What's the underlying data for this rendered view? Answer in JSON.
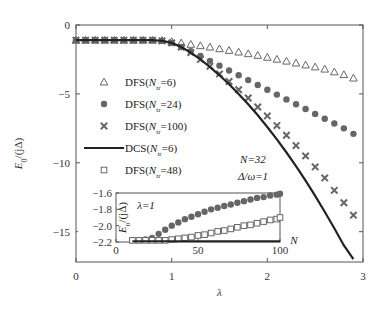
{
  "chart_data": [
    {
      "type": "line",
      "title": "",
      "xlabel": "λ",
      "ylabel": "E0/(jΔ)",
      "xlim": [
        0,
        3
      ],
      "ylim": [
        -17.2,
        0
      ],
      "xticks": [
        0,
        1,
        2,
        3
      ],
      "yticks": [
        0,
        -5,
        -10,
        -15
      ],
      "xtick_labels": [
        "0",
        "1",
        "2",
        "3"
      ],
      "ytick_labels": [
        "0",
        "−5",
        "−10",
        "−15"
      ],
      "grid": false,
      "legend_position": "left",
      "annotations": [
        "N=32",
        "Δ/ω=1"
      ],
      "x": [
        0,
        0.1,
        0.2,
        0.3,
        0.4,
        0.5,
        0.6,
        0.7,
        0.8,
        0.9,
        1.0,
        1.1,
        1.2,
        1.3,
        1.4,
        1.5,
        1.6,
        1.7,
        1.8,
        1.9,
        2.0,
        2.1,
        2.2,
        2.3,
        2.4,
        2.5,
        2.6,
        2.7,
        2.8,
        2.9
      ],
      "series": [
        {
          "name": "DFS(Ntr=6)",
          "marker": "triangle",
          "values": [
            -1.1,
            -1.1,
            -1.1,
            -1.1,
            -1.1,
            -1.1,
            -1.1,
            -1.1,
            -1.1,
            -1.12,
            -1.2,
            -1.3,
            -1.4,
            -1.5,
            -1.6,
            -1.72,
            -1.84,
            -1.96,
            -2.08,
            -2.2,
            -2.34,
            -2.48,
            -2.62,
            -2.76,
            -2.9,
            -3.04,
            -3.2,
            -3.4,
            -3.6,
            -3.85
          ]
        },
        {
          "name": "DFS(Ntr=24)",
          "marker": "circle",
          "values": [
            -1.1,
            -1.1,
            -1.1,
            -1.1,
            -1.1,
            -1.1,
            -1.1,
            -1.1,
            -1.1,
            -1.15,
            -1.3,
            -1.6,
            -1.9,
            -2.25,
            -2.6,
            -2.95,
            -3.3,
            -3.65,
            -4.0,
            -4.35,
            -4.7,
            -5.05,
            -5.4,
            -5.75,
            -6.1,
            -6.45,
            -6.8,
            -7.15,
            -7.5,
            -7.9
          ]
        },
        {
          "name": "DFS(Ntr=100)",
          "marker": "cross",
          "values": [
            -1.1,
            -1.1,
            -1.1,
            -1.1,
            -1.1,
            -1.1,
            -1.1,
            -1.1,
            -1.1,
            -1.15,
            -1.3,
            -1.6,
            -2.0,
            -2.5,
            -3.0,
            -3.55,
            -4.1,
            -4.7,
            -5.3,
            -5.95,
            -6.6,
            -7.3,
            -8.0,
            -8.75,
            -9.5,
            -10.3,
            -11.1,
            -12.0,
            -12.9,
            -13.8
          ]
        },
        {
          "name": "DCS(Ntr=6)",
          "marker": "line",
          "values": [
            -1.1,
            -1.1,
            -1.1,
            -1.1,
            -1.1,
            -1.1,
            -1.1,
            -1.1,
            -1.1,
            -1.15,
            -1.3,
            -1.6,
            -2.0,
            -2.5,
            -3.05,
            -3.65,
            -4.3,
            -5.0,
            -5.75,
            -6.55,
            -7.4,
            -8.3,
            -9.25,
            -10.25,
            -11.3,
            -12.4,
            -13.55,
            -14.75,
            -16.0,
            -17.0
          ]
        },
        {
          "name": "DFS(Ntr=48)",
          "marker": "square",
          "values": []
        }
      ]
    },
    {
      "type": "line",
      "title": "",
      "xlabel": "N",
      "ylabel": "E0/(jΔ)",
      "annotation": "λ=1",
      "xlim": [
        0,
        100
      ],
      "ylim": [
        -2.2,
        -1.6
      ],
      "xticks": [
        0,
        50,
        100
      ],
      "yticks": [
        -1.6,
        -1.8,
        -2.0,
        -2.2
      ],
      "xtick_labels": [
        "0",
        "50",
        "100"
      ],
      "ytick_labels": [
        "−1.6",
        "−1.8",
        "−2.0",
        "−2.2"
      ],
      "x": [
        10,
        14,
        18,
        22,
        26,
        30,
        34,
        38,
        42,
        46,
        50,
        54,
        58,
        62,
        66,
        70,
        74,
        78,
        82,
        86,
        90,
        94,
        98,
        100
      ],
      "series": [
        {
          "name": "DFS(Ntr=24)",
          "marker": "circle",
          "values": [
            -2.18,
            -2.18,
            -2.17,
            -2.15,
            -2.1,
            -2.05,
            -2.0,
            -1.96,
            -1.92,
            -1.89,
            -1.86,
            -1.83,
            -1.8,
            -1.78,
            -1.76,
            -1.74,
            -1.72,
            -1.7,
            -1.68,
            -1.66,
            -1.65,
            -1.63,
            -1.62,
            -1.61
          ]
        },
        {
          "name": "DFS(Ntr=48)",
          "marker": "square",
          "values": [
            -2.18,
            -2.18,
            -2.18,
            -2.18,
            -2.18,
            -2.18,
            -2.17,
            -2.16,
            -2.15,
            -2.14,
            -2.12,
            -2.11,
            -2.09,
            -2.07,
            -2.06,
            -2.04,
            -2.02,
            -2.0,
            -1.99,
            -1.97,
            -1.95,
            -1.93,
            -1.92,
            -1.9
          ]
        },
        {
          "name": "DCS(Ntr=6)",
          "marker": "line",
          "values": [
            -2.19,
            -2.19,
            -2.19,
            -2.19,
            -2.19,
            -2.19,
            -2.19,
            -2.19,
            -2.19,
            -2.19,
            -2.19,
            -2.19,
            -2.19,
            -2.19,
            -2.19,
            -2.19,
            -2.19,
            -2.19,
            -2.19,
            -2.19,
            -2.19,
            -2.19,
            -2.19,
            -2.19
          ]
        }
      ]
    }
  ],
  "legend": [
    {
      "prefix": "DFS(",
      "sub": "tr",
      "suffix": "=6)",
      "marker": "triangle"
    },
    {
      "prefix": "DFS(",
      "sub": "tr",
      "suffix": "=24)",
      "marker": "circle"
    },
    {
      "prefix": "DFS(",
      "sub": "tr",
      "suffix": "=100)",
      "marker": "cross"
    },
    {
      "prefix": "DCS(",
      "sub": "tr",
      "suffix": "=6)",
      "marker": "line"
    },
    {
      "prefix": "DFS(",
      "sub": "tr",
      "suffix": "=48)",
      "marker": "square"
    }
  ],
  "labels": {
    "x_main": "λ",
    "y_main_E": "E",
    "y_main_sub": "0",
    "y_main_rest": "/(jΔ)",
    "ann_N": "N=32",
    "ann_ratio": "Δ/ω=1",
    "inset_x": "N",
    "inset_lambda": "λ=1",
    "legend_N": "N"
  },
  "colors": {
    "marker": "#666666",
    "line": "#222222",
    "axis": "#555555"
  }
}
